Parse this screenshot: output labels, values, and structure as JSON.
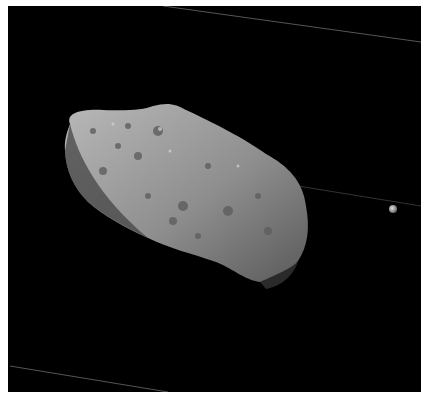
{
  "image": {
    "subject": "asteroid-with-small-moon",
    "alt": "Grayscale space photograph of a cratered, elongated asteroid with a small moon to its right against a black background",
    "colors": {
      "background": "#000000",
      "surface_light": "#bdbdbd",
      "surface_mid": "#8a8a8a",
      "surface_dark": "#3a3a3a",
      "moon": "#cfcfcf"
    }
  }
}
